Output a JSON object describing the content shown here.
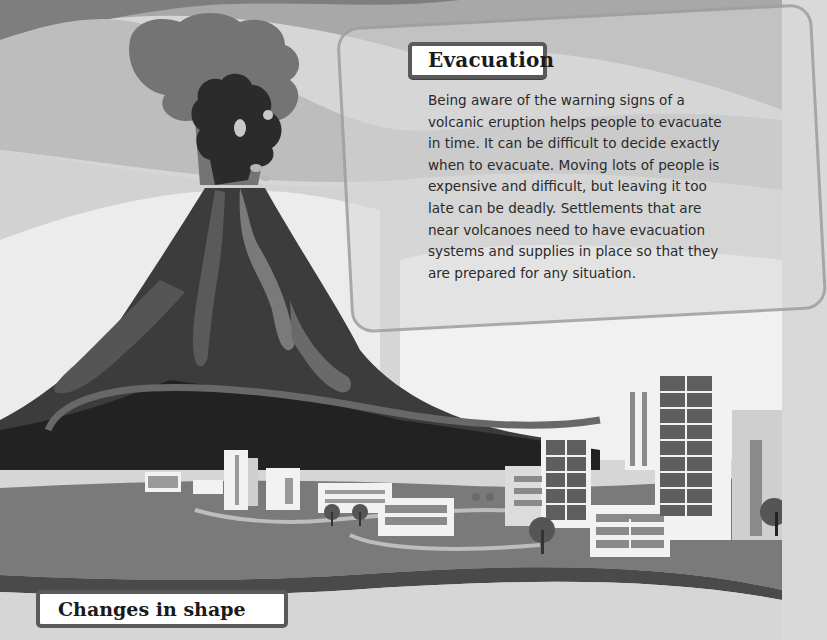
{
  "page": {
    "section_heading": "Evacuation",
    "section_body_lines": [
      "Being aware of the warning signs of a",
      "volcanic eruption helps people to evacuate",
      "in time. It can be difficult to decide exactly",
      "when to evacuate. Moving lots of people is",
      "expensive and difficult, but leaving it too",
      "late can be deadly. Settlements that are",
      "near volcanoes need to have evacuation",
      "systems and supplies in place so that they",
      "are prepared for any situation."
    ],
    "next_section_heading": "Changes in shape"
  },
  "illustration": {
    "subject": "erupting-volcano-near-city",
    "palette": {
      "sky": "#d9d9d9",
      "cloud_light": "#cfcfcf",
      "cloud_mid": "#9a9a9a",
      "ash_plume": "#6e6e6e",
      "ash_dark": "#2e2e2e",
      "volcano": "#3a3a3a",
      "volcano_dark": "#1c1c1c",
      "lava": "#6f6f6f",
      "ground": "#7a7a7a",
      "ground_edge": "#4a4a4a",
      "building": "#f2f2f2",
      "window": "#5e5e5e"
    }
  }
}
